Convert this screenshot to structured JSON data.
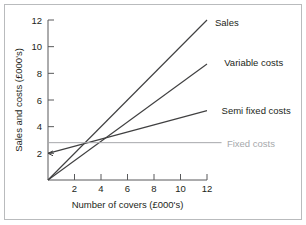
{
  "figure": {
    "border_color": "#b9bbbd",
    "background": "#ffffff"
  },
  "chart_data": {
    "type": "line",
    "title": "",
    "xlabel": "Number of covers (£000's)",
    "ylabel": "Sales and costs (£000's)",
    "xlim": [
      0,
      12
    ],
    "ylim": [
      0,
      12
    ],
    "xticks": [
      2,
      4,
      6,
      8,
      10,
      12
    ],
    "yticks": [
      2,
      4,
      6,
      8,
      10,
      12
    ],
    "xtick_labels": [
      "2",
      "4",
      "6",
      "8",
      "10",
      "12"
    ],
    "ytick_labels": [
      "2",
      "4",
      "6",
      "8",
      "10",
      "12"
    ],
    "grid": false,
    "legend": "inline-right-of-line-ends",
    "series": [
      {
        "name": "Sales",
        "label": "Sales",
        "color": "#404041",
        "x": [
          0,
          12
        ],
        "values": [
          0,
          12
        ],
        "label_x": 12.6,
        "label_y": 11.85
      },
      {
        "name": "Variable costs",
        "label": "Variable costs",
        "color": "#404041",
        "x": [
          0,
          12
        ],
        "values": [
          0,
          8.7
        ],
        "label_x": 13.3,
        "label_y": 8.8
      },
      {
        "name": "Semi fixed costs",
        "label": "Semi fixed costs",
        "color": "#404041",
        "x": [
          0,
          12
        ],
        "values": [
          2.0,
          5.2
        ],
        "label_x": 13.1,
        "label_y": 5.25,
        "start_marker": "left-arrow"
      },
      {
        "name": "Fixed costs",
        "label": "Fixed costs",
        "color": "#a6a8ab",
        "x": [
          0,
          13.1
        ],
        "values": [
          2.8,
          2.8
        ],
        "label_x": 13.5,
        "label_y": 2.75,
        "muted": true
      }
    ]
  }
}
